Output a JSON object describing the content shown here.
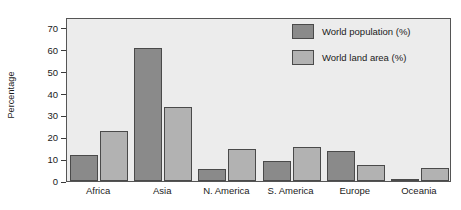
{
  "chart_data": {
    "type": "bar",
    "title": "",
    "subtitle": "",
    "xlabel": "",
    "ylabel": "Percentage",
    "ylim": [
      0,
      75
    ],
    "yticks": [
      0,
      10,
      20,
      30,
      40,
      50,
      60,
      70
    ],
    "grid": false,
    "legend_position": "top-right",
    "categories": [
      "Africa",
      "Asia",
      "N. America",
      "S. America",
      "Europe",
      "Oceania"
    ],
    "series": [
      {
        "name": "World population (%)",
        "color": "#8a8a8a",
        "values": [
          12,
          61,
          5.5,
          9,
          13.5,
          1
        ]
      },
      {
        "name": "World land area (%)",
        "color": "#b2b2b2",
        "values": [
          23,
          34,
          14.5,
          15.5,
          7.5,
          6
        ]
      }
    ]
  },
  "colors": {
    "plot_background": "#ececec",
    "axis": "#555555",
    "text": "#1a1a1a",
    "page_background": "#ffffff"
  }
}
